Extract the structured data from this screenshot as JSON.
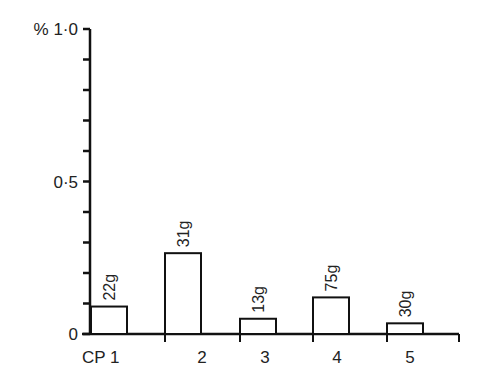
{
  "chart_data": {
    "type": "bar",
    "title": "",
    "xlabel": "",
    "ylabel": "%",
    "ylim": [
      0,
      1.0
    ],
    "y_ticks": [
      0,
      0.1,
      0.2,
      0.3,
      0.4,
      0.5,
      0.6,
      0.7,
      0.8,
      0.9,
      1.0
    ],
    "y_tick_labels": [
      {
        "value": 0,
        "label": "0"
      },
      {
        "value": 0.5,
        "label": "0·5"
      },
      {
        "value": 1.0,
        "label": "% 1·0"
      }
    ],
    "categories": [
      "CP 1",
      "2",
      "3",
      "4",
      "5"
    ],
    "values": [
      0.09,
      0.265,
      0.05,
      0.12,
      0.035
    ],
    "bar_annotations": [
      "22g",
      "31g",
      "13g",
      "75g",
      "30g"
    ],
    "grid": false,
    "legend": null,
    "bar_fill": "#ffffff",
    "bar_stroke": "#111111"
  }
}
